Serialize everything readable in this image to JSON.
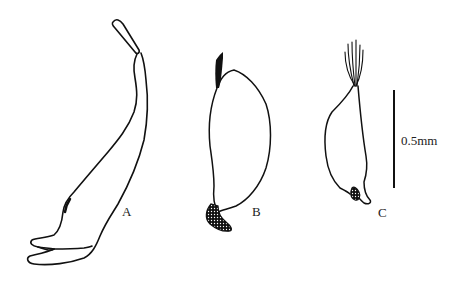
{
  "figure": {
    "panels": [
      {
        "id": "A",
        "label": "A"
      },
      {
        "id": "B",
        "label": "B"
      },
      {
        "id": "C",
        "label": "C"
      }
    ],
    "scale_bar": {
      "label": "0.5mm"
    },
    "colors": {
      "line": "#111111",
      "background": "#ffffff"
    }
  }
}
